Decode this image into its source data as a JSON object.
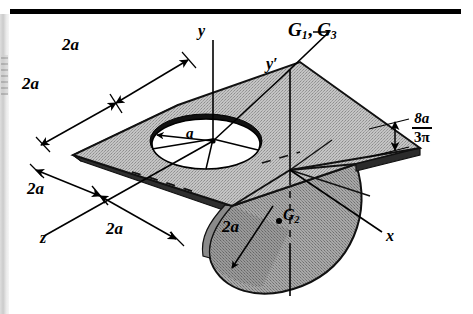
{
  "figure": {
    "top_rule_color": "#000000",
    "plate_fill": "#b9b9b9",
    "flange_fill": "#9c9c9c",
    "edge_color": "#1a1a1a",
    "hole_fill": "#ffffff",
    "line_color": "#000000"
  },
  "axes": {
    "y": "y",
    "y_prime": "y′",
    "x": "x",
    "z": "z"
  },
  "centroids": {
    "g1_g3": "G₁, G₃",
    "g1_g3_parts": {
      "base": "G",
      "sub1": "1",
      "sep": ", ",
      "base2": "G",
      "sub2": "3"
    },
    "g2_parts": {
      "base": "G",
      "sub": "2"
    }
  },
  "dimensions": {
    "top_left_outer": "2a",
    "top_left_inner": "2a",
    "bottom_left_outer": "2a",
    "bottom_left_inner": "2a",
    "flange_depth": "2a",
    "hole_radius": "a",
    "centroid_offset": {
      "numerator": "8a",
      "denominator_coef": "3",
      "denominator_symbol": "π"
    }
  }
}
